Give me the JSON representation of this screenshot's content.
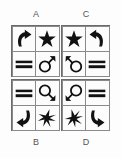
{
  "figure": {
    "type": "symbol-grid-puzzle",
    "background_color": "#fdfdfd",
    "glyph_color": "#111111",
    "border_color": "#6b6b6b",
    "panel_count": 4,
    "grid_size": "2x2"
  },
  "labels": {
    "a": "A",
    "c": "C",
    "b": "B",
    "d": "D"
  },
  "panels": [
    {
      "id": "A",
      "label": "A",
      "position": "top-left",
      "cells": [
        {
          "slot": "top-left",
          "icon": "curved-arrow-up-right-icon",
          "name": "curved arrow pointing up-right"
        },
        {
          "slot": "top-right",
          "icon": "five-point-star-icon",
          "name": "filled five pointed star"
        },
        {
          "slot": "bottom-left",
          "icon": "double-bar-icon",
          "name": "two thick horizontal bars"
        },
        {
          "slot": "bottom-right",
          "icon": "mars-symbol-up-right-icon",
          "name": "mars symbol arrow up-right"
        }
      ]
    },
    {
      "id": "C",
      "label": "C",
      "position": "top-right",
      "cells": [
        {
          "slot": "top-left",
          "icon": "five-point-star-icon",
          "name": "filled five pointed star"
        },
        {
          "slot": "top-right",
          "icon": "curved-arrow-up-left-icon",
          "name": "curved arrow pointing up-left"
        },
        {
          "slot": "bottom-left",
          "icon": "mars-symbol-up-left-icon",
          "name": "mars symbol arrow up-left"
        },
        {
          "slot": "bottom-right",
          "icon": "double-bar-icon",
          "name": "two thick horizontal bars"
        }
      ]
    },
    {
      "id": "B",
      "label": "B",
      "position": "bottom-left",
      "cells": [
        {
          "slot": "top-left",
          "icon": "double-bar-icon",
          "name": "two thick horizontal bars"
        },
        {
          "slot": "top-right",
          "icon": "mars-symbol-down-right-icon",
          "name": "mars symbol arrow down-right"
        },
        {
          "slot": "bottom-left",
          "icon": "curved-arrow-down-left-icon",
          "name": "curved arrow pointing down-left"
        },
        {
          "slot": "bottom-right",
          "icon": "six-point-star-icon",
          "name": "six pointed star burst"
        }
      ]
    },
    {
      "id": "D",
      "label": "D",
      "position": "bottom-right",
      "cells": [
        {
          "slot": "top-left",
          "icon": "mars-symbol-down-left-icon",
          "name": "mars symbol arrow down-left"
        },
        {
          "slot": "top-right",
          "icon": "double-bar-icon",
          "name": "two thick horizontal bars"
        },
        {
          "slot": "bottom-left",
          "icon": "six-point-star-icon",
          "name": "six pointed star burst"
        },
        {
          "slot": "bottom-right",
          "icon": "curved-arrow-down-right-icon",
          "name": "curved arrow pointing down-right"
        }
      ]
    }
  ]
}
